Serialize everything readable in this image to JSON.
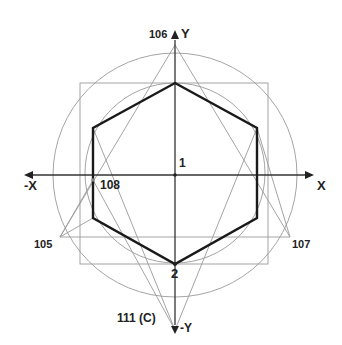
{
  "diagram": {
    "axes": {
      "x_pos": "X",
      "x_neg": "-X",
      "y_pos": "Y",
      "y_neg": "-Y"
    },
    "points": {
      "center": "1",
      "bottom_vertex": "2",
      "top": "106",
      "left_axis": "108",
      "lower_left": "105",
      "lower_right": "107",
      "bottom": "111 (C)"
    },
    "colors": {
      "hexagon": "#1a1a1a",
      "construction": "#9a9a9a",
      "axis": "#333333",
      "background": "#ffffff"
    }
  }
}
